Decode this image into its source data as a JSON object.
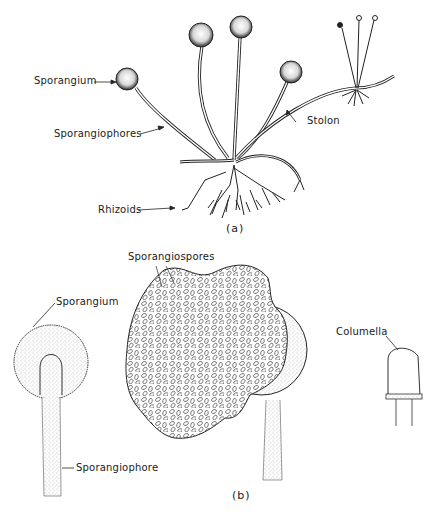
{
  "figure": {
    "panel_a": {
      "label": "(a)",
      "labels": {
        "sporangium": "Sporangium",
        "sporangiophores": "Sporangiophores",
        "stolon": "Stolon",
        "rhizoids": "Rhizoids"
      }
    },
    "panel_b": {
      "label": "(b)",
      "labels": {
        "sporangiospores": "Sporangiospores",
        "sporangium": "Sporangium",
        "sporangiophore": "Sporangiophore",
        "columella": "Columella"
      }
    }
  },
  "colors": {
    "ink": "#1a1a1a",
    "stipple": "#8a8a8a",
    "background": "#ffffff"
  }
}
